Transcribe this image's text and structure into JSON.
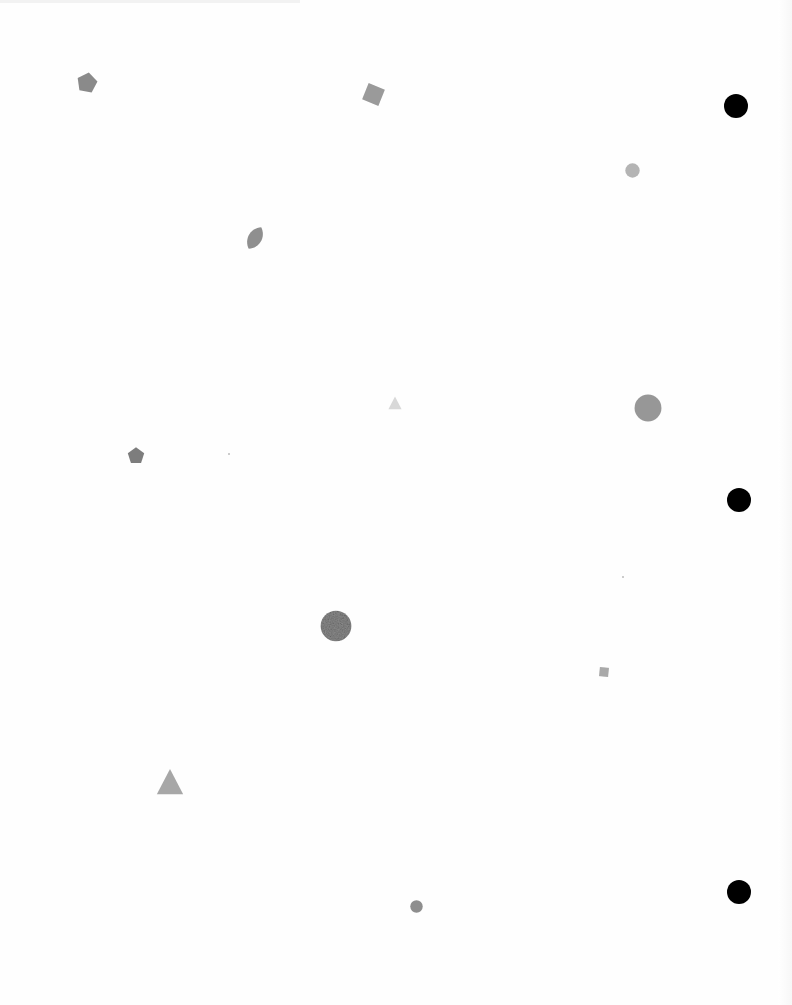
{
  "page": {
    "background": "#fefefe"
  },
  "punch_holes": [
    {
      "name": "punch-hole-top",
      "cx": 736,
      "cy": 106,
      "r": 12,
      "color": "#000000"
    },
    {
      "name": "punch-hole-middle",
      "cx": 739,
      "cy": 500,
      "r": 12,
      "color": "#000000"
    },
    {
      "name": "punch-hole-bottom",
      "cx": 739,
      "cy": 892,
      "r": 12,
      "color": "#000000"
    }
  ],
  "shapes": [
    {
      "name": "pentagon-shape",
      "type": "pentagon",
      "cx": 87,
      "cy": 83,
      "size": 22,
      "rotate": 10,
      "color": "#8a8a8a"
    },
    {
      "name": "square-shape",
      "type": "square",
      "cx": 373,
      "cy": 94,
      "size": 19,
      "rotate": 22,
      "color": "#9a9a9a"
    },
    {
      "name": "circle-shape",
      "type": "circle",
      "cx": 632,
      "cy": 170,
      "size": 15,
      "color": "#b4b4b4"
    },
    {
      "name": "leaf-shape",
      "type": "leaf",
      "cx": 255,
      "cy": 238,
      "size": 26,
      "rotate": 30,
      "color": "#8f8f8f"
    },
    {
      "name": "triangle-shape",
      "type": "triangle",
      "cx": 395,
      "cy": 403,
      "size": 14,
      "color": "#d8d8d8"
    },
    {
      "name": "circle-shape",
      "type": "circle",
      "cx": 648,
      "cy": 408,
      "size": 28,
      "color": "#979797"
    },
    {
      "name": "pentagon-shape",
      "type": "pentagon",
      "cx": 136,
      "cy": 456,
      "size": 18,
      "rotate": 0,
      "color": "#7d7d7d"
    },
    {
      "name": "textured-circle-shape",
      "type": "textured-circle",
      "cx": 336,
      "cy": 626,
      "size": 32,
      "color": "#8c8c8c"
    },
    {
      "name": "square-shape",
      "type": "square",
      "cx": 604,
      "cy": 672,
      "size": 10,
      "rotate": 5,
      "color": "#a9a9a9"
    },
    {
      "name": "triangle-shape",
      "type": "triangle",
      "cx": 170,
      "cy": 782,
      "size": 28,
      "color": "#a7a7a7"
    },
    {
      "name": "circle-shape",
      "type": "circle",
      "cx": 416,
      "cy": 906,
      "size": 13,
      "color": "#8e8e8e"
    }
  ],
  "specks": [
    {
      "x": 228,
      "y": 453
    },
    {
      "x": 622,
      "y": 576
    }
  ]
}
